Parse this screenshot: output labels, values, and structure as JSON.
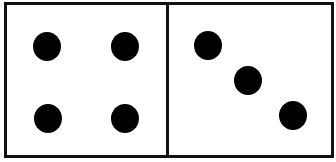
{
  "figure": {
    "type": "domino",
    "colors": {
      "border": "#111111",
      "pip": "#000000",
      "face": "#ffffff"
    },
    "left_half": {
      "pip_count": 4,
      "pips": [
        {
          "x": 47,
          "y": 44
        },
        {
          "x": 125,
          "y": 44
        },
        {
          "x": 48,
          "y": 116
        },
        {
          "x": 125,
          "y": 116
        }
      ]
    },
    "right_half": {
      "pip_count": 3,
      "pips": [
        {
          "x": 208,
          "y": 43
        },
        {
          "x": 248,
          "y": 78
        },
        {
          "x": 293,
          "y": 113
        }
      ]
    }
  }
}
